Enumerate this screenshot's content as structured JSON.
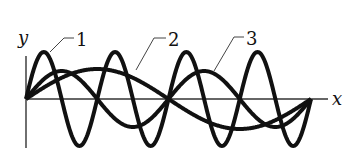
{
  "diagram": {
    "axes": {
      "x_label": "x",
      "y_label": "y"
    },
    "curves": [
      {
        "label": "1",
        "periods": 4,
        "amplitude": 47
      },
      {
        "label": "2",
        "periods": 1,
        "amplitude": 30
      },
      {
        "label": "3",
        "periods": 2,
        "amplitude": 28
      }
    ],
    "colors": {
      "stroke": "#111111",
      "axis": "#333333",
      "leader": "#444444"
    }
  }
}
